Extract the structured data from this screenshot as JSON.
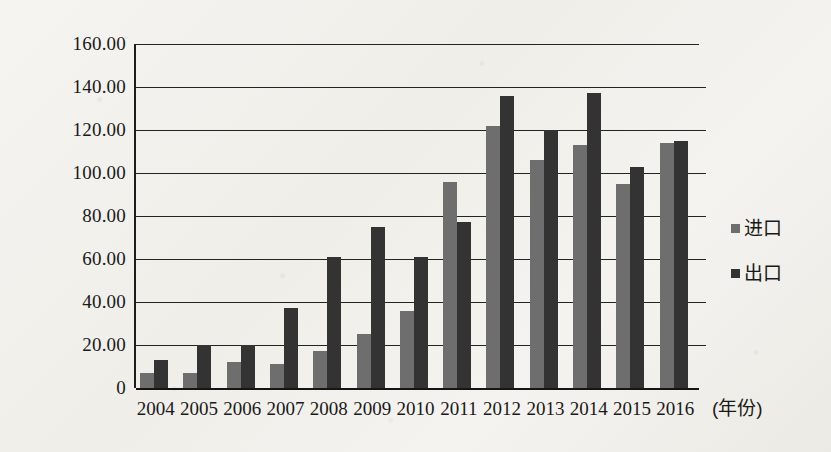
{
  "chart_data": {
    "type": "bar",
    "title": "",
    "xlabel": "(年份)",
    "ylabel": "",
    "categories": [
      "2004",
      "2005",
      "2006",
      "2007",
      "2008",
      "2009",
      "2010",
      "2011",
      "2012",
      "2013",
      "2014",
      "2015",
      "2016"
    ],
    "series": [
      {
        "name": "进口",
        "color": "#6e6e6e",
        "values": [
          7,
          7,
          12,
          11,
          17,
          25,
          36,
          96,
          122,
          106,
          113,
          95,
          114
        ]
      },
      {
        "name": "出口",
        "color": "#333333",
        "values": [
          13,
          20,
          20,
          37,
          61,
          75,
          61,
          77,
          136,
          120,
          137,
          103,
          115
        ]
      }
    ],
    "ylim": [
      0,
      160
    ],
    "ytick_values": [
      0,
      20,
      40,
      60,
      80,
      100,
      120,
      140,
      160
    ],
    "ytick_labels": [
      "0",
      "20.00",
      "40.00",
      "60.00",
      "80.00",
      "100.00",
      "120.00",
      "140.00",
      "160.00"
    ],
    "grid": true,
    "legend_position": "right"
  },
  "legend": {
    "items": [
      {
        "label": "进口",
        "swatch": "legend-swatch-import"
      },
      {
        "label": "出口",
        "swatch": "legend-swatch-export"
      }
    ]
  },
  "axis": {
    "x_title": "(年份)"
  }
}
